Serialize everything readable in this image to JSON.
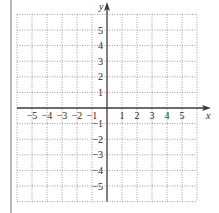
{
  "figure": {
    "type": "coordinate-grid",
    "x_axis": {
      "label": "x",
      "min": -6,
      "max": 6,
      "tick_labels": [
        "-5",
        "-4",
        "-3",
        "-2",
        "-1",
        "1",
        "2",
        "3",
        "4",
        "5"
      ],
      "tick_values": [
        -5,
        -4,
        -3,
        -2,
        -1,
        1,
        2,
        3,
        4,
        5
      ]
    },
    "y_axis": {
      "label": "y",
      "min": -6,
      "max": 6,
      "tick_labels": [
        "5",
        "4",
        "3",
        "2",
        "1",
        "-1",
        "-2",
        "-3",
        "-4",
        "-5"
      ],
      "tick_values": [
        5,
        4,
        3,
        2,
        1,
        -1,
        -2,
        -3,
        -4,
        -5
      ]
    },
    "grid": {
      "style": "dotted",
      "step": 1
    },
    "colors": {
      "axis": "#3a3a3a",
      "grid": "#9a9a9a",
      "border": "#b0b0b0",
      "text": "#2a2a2a"
    }
  }
}
